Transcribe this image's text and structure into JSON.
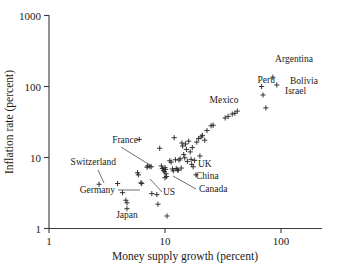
{
  "chart_data": {
    "type": "scatter",
    "title": "",
    "xlabel": "Money supply growth (percent)",
    "ylabel": "Inflation rate (percent)",
    "xscale": "log",
    "yscale": "log",
    "xlim": [
      1,
      250
    ],
    "ylim": [
      1,
      1000
    ],
    "grid": false,
    "legend": null,
    "xticks": [
      1,
      10,
      100
    ],
    "xticklabels": [
      "1",
      "10",
      "100"
    ],
    "yticks": [
      1,
      10,
      100,
      1000
    ],
    "yticklabels": [
      "1",
      "10",
      "100",
      "1000"
    ],
    "marker": "plus",
    "marker_color": "#2b2b2b",
    "points": [
      {
        "x": 2.7,
        "y": 4.2,
        "label": "Switzerland"
      },
      {
        "x": 3.9,
        "y": 4.3,
        "label": "Germany"
      },
      {
        "x": 4.7,
        "y": 1.9,
        "label": "Japan"
      },
      {
        "x": 7.1,
        "y": 7.6,
        "label": "France"
      },
      {
        "x": 10.0,
        "y": 5.2,
        "label": "US"
      },
      {
        "x": 17.5,
        "y": 7.4,
        "label": "UK"
      },
      {
        "x": 18.5,
        "y": 5.7,
        "label": "China"
      },
      {
        "x": 13.0,
        "y": 6.6,
        "label": "Canada"
      },
      {
        "x": 40.0,
        "y": 42.0,
        "label": "Mexico"
      },
      {
        "x": 85.0,
        "y": 135.0,
        "label": "Argentina"
      },
      {
        "x": 68.0,
        "y": 100.0,
        "label": "Peru"
      },
      {
        "x": 92.0,
        "y": 105.0,
        "label": "Bolivia"
      },
      {
        "x": 70.0,
        "y": 76.0,
        "label": "Israel"
      },
      {
        "x": 74.0,
        "y": 50.0,
        "label": ""
      },
      {
        "x": 4.3,
        "y": 3.2,
        "label": ""
      },
      {
        "x": 4.6,
        "y": 2.5,
        "label": ""
      },
      {
        "x": 4.7,
        "y": 2.3,
        "label": ""
      },
      {
        "x": 5.8,
        "y": 6.1,
        "label": ""
      },
      {
        "x": 5.9,
        "y": 5.7,
        "label": ""
      },
      {
        "x": 6.0,
        "y": 18.0,
        "label": ""
      },
      {
        "x": 6.2,
        "y": 4.4,
        "label": ""
      },
      {
        "x": 6.3,
        "y": 4.3,
        "label": ""
      },
      {
        "x": 7.0,
        "y": 7.3,
        "label": ""
      },
      {
        "x": 7.4,
        "y": 7.5,
        "label": ""
      },
      {
        "x": 7.6,
        "y": 7.4,
        "label": ""
      },
      {
        "x": 7.7,
        "y": 3.1,
        "label": ""
      },
      {
        "x": 8.5,
        "y": 3.0,
        "label": ""
      },
      {
        "x": 8.7,
        "y": 2.2,
        "label": ""
      },
      {
        "x": 9.0,
        "y": 13.5,
        "label": ""
      },
      {
        "x": 9.3,
        "y": 7.6,
        "label": ""
      },
      {
        "x": 9.5,
        "y": 7.0,
        "label": ""
      },
      {
        "x": 9.7,
        "y": 6.6,
        "label": ""
      },
      {
        "x": 9.9,
        "y": 6.3,
        "label": ""
      },
      {
        "x": 10.0,
        "y": 7.2,
        "label": ""
      },
      {
        "x": 10.1,
        "y": 6.8,
        "label": ""
      },
      {
        "x": 10.2,
        "y": 5.9,
        "label": ""
      },
      {
        "x": 10.3,
        "y": 5.4,
        "label": ""
      },
      {
        "x": 10.4,
        "y": 1.5,
        "label": ""
      },
      {
        "x": 11.0,
        "y": 9.0,
        "label": ""
      },
      {
        "x": 11.3,
        "y": 8.6,
        "label": ""
      },
      {
        "x": 11.6,
        "y": 6.9,
        "label": ""
      },
      {
        "x": 11.8,
        "y": 6.5,
        "label": ""
      },
      {
        "x": 12.0,
        "y": 19.0,
        "label": ""
      },
      {
        "x": 12.3,
        "y": 9.3,
        "label": ""
      },
      {
        "x": 12.5,
        "y": 7.0,
        "label": ""
      },
      {
        "x": 12.8,
        "y": 6.7,
        "label": ""
      },
      {
        "x": 13.2,
        "y": 9.2,
        "label": ""
      },
      {
        "x": 13.5,
        "y": 9.6,
        "label": ""
      },
      {
        "x": 13.8,
        "y": 7.1,
        "label": ""
      },
      {
        "x": 14.0,
        "y": 16.0,
        "label": ""
      },
      {
        "x": 14.2,
        "y": 14.5,
        "label": ""
      },
      {
        "x": 14.5,
        "y": 11.0,
        "label": ""
      },
      {
        "x": 14.8,
        "y": 9.9,
        "label": ""
      },
      {
        "x": 15.0,
        "y": 15.5,
        "label": ""
      },
      {
        "x": 15.3,
        "y": 13.0,
        "label": ""
      },
      {
        "x": 15.6,
        "y": 8.8,
        "label": ""
      },
      {
        "x": 16.0,
        "y": 17.0,
        "label": ""
      },
      {
        "x": 16.5,
        "y": 12.0,
        "label": ""
      },
      {
        "x": 16.8,
        "y": 9.4,
        "label": ""
      },
      {
        "x": 17.0,
        "y": 8.0,
        "label": ""
      },
      {
        "x": 17.2,
        "y": 13.8,
        "label": ""
      },
      {
        "x": 18.0,
        "y": 9.1,
        "label": ""
      },
      {
        "x": 18.8,
        "y": 16.5,
        "label": ""
      },
      {
        "x": 19.5,
        "y": 18.5,
        "label": ""
      },
      {
        "x": 20.0,
        "y": 10.5,
        "label": ""
      },
      {
        "x": 20.5,
        "y": 19.5,
        "label": ""
      },
      {
        "x": 21.0,
        "y": 20.5,
        "label": ""
      },
      {
        "x": 22.0,
        "y": 17.5,
        "label": ""
      },
      {
        "x": 23.0,
        "y": 24.0,
        "label": ""
      },
      {
        "x": 25.0,
        "y": 28.0,
        "label": ""
      },
      {
        "x": 26.0,
        "y": 28.5,
        "label": ""
      },
      {
        "x": 33.0,
        "y": 36.0,
        "label": ""
      },
      {
        "x": 35.0,
        "y": 38.0,
        "label": ""
      },
      {
        "x": 38.0,
        "y": 41.0,
        "label": ""
      },
      {
        "x": 42.0,
        "y": 45.0,
        "label": ""
      }
    ],
    "annotations": [
      {
        "text": "Switzerland",
        "anchor": "end",
        "tx": 116,
        "ty": 165,
        "lx": 98,
        "ly": 170,
        "px": 104,
        "py": 183
      },
      {
        "text": "Germany",
        "anchor": "end",
        "tx": 115,
        "ty": 193,
        "lx": 118,
        "ly": 190,
        "px": 140,
        "py": 190
      },
      {
        "text": "Japan",
        "anchor": "middle",
        "tx": 127,
        "ty": 218,
        "lx": null,
        "ly": null,
        "px": null,
        "py": null
      },
      {
        "text": "France",
        "anchor": "end",
        "tx": 138,
        "ty": 143,
        "lx": 121,
        "ly": 147,
        "px": 153,
        "py": 167
      },
      {
        "text": "US",
        "anchor": "start",
        "tx": 163,
        "ty": 195,
        "lx": 162,
        "ly": 192,
        "px": 150,
        "py": 179
      },
      {
        "text": "Canada",
        "anchor": "start",
        "tx": 199,
        "ty": 192,
        "lx": 196,
        "ly": 189,
        "px": 173,
        "py": 176
      },
      {
        "text": "UK",
        "anchor": "start",
        "tx": 198,
        "ty": 167,
        "lx": null,
        "ly": null,
        "px": null,
        "py": null
      },
      {
        "text": "China",
        "anchor": "start",
        "tx": 196,
        "ty": 179,
        "lx": null,
        "ly": null,
        "px": null,
        "py": null
      },
      {
        "text": "Mexico",
        "anchor": "middle",
        "tx": 224,
        "ty": 103,
        "lx": null,
        "ly": null,
        "px": null,
        "py": null
      },
      {
        "text": "Argentina",
        "anchor": "middle",
        "tx": 294,
        "ty": 62,
        "lx": null,
        "ly": null,
        "px": null,
        "py": null
      },
      {
        "text": "Peru",
        "anchor": "end",
        "tx": 275,
        "ty": 83,
        "lx": null,
        "ly": null,
        "px": null,
        "py": null
      },
      {
        "text": "Bolivia",
        "anchor": "start",
        "tx": 290,
        "ty": 84,
        "lx": null,
        "ly": null,
        "px": null,
        "py": null
      },
      {
        "text": "Israel",
        "anchor": "start",
        "tx": 285,
        "ty": 94,
        "lx": null,
        "ly": null,
        "px": null,
        "py": null
      }
    ]
  },
  "axes": {
    "x_title": "Money supply growth (percent)",
    "y_title": "Inflation rate (percent)",
    "x_tick_labels": [
      "1",
      "10",
      "100"
    ],
    "y_tick_labels": [
      "1000",
      "100",
      "10",
      "1"
    ]
  },
  "colors": {
    "background": "#ffffff",
    "axis": "#3a3a3a",
    "marker": "#2b2b2b",
    "text": "#1a1a1a"
  }
}
